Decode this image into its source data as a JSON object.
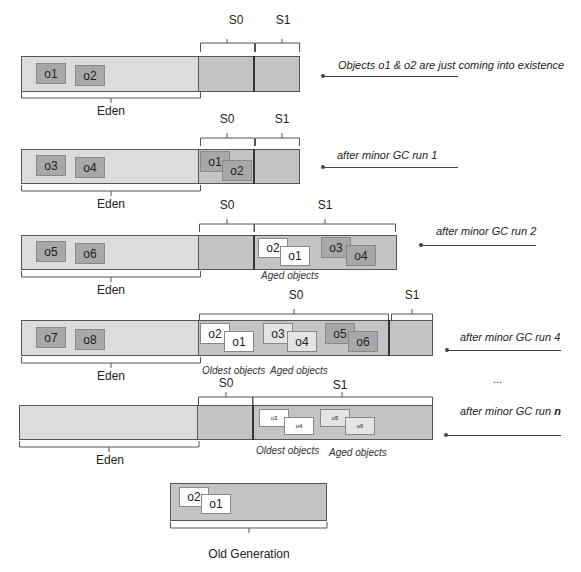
{
  "diagram": {
    "labels": {
      "eden": "Eden",
      "s0": "S0",
      "s1": "S1",
      "old_generation": "Old Generation",
      "aged_objects": "Aged objects",
      "oldest_objects": "Oldest objects",
      "ellipsis": "..."
    },
    "rows": [
      {
        "note": "Objects o1 & o2 are just coming into existence",
        "eden_objects": [
          "o1",
          "o2"
        ],
        "s0_objects": [],
        "s1_objects": []
      },
      {
        "note": "after minor GC run 1",
        "eden_objects": [
          "o3",
          "o4"
        ],
        "s0_objects": [
          "o1",
          "o2"
        ],
        "s1_objects": []
      },
      {
        "note": "after minor GC run 2",
        "eden_objects": [
          "o5",
          "o6"
        ],
        "s0_objects": [],
        "s1_objects": [
          "o2",
          "o1",
          "o3",
          "o4"
        ],
        "s1_caption": "Aged objects"
      },
      {
        "note": "after minor GC run 4",
        "eden_objects": [
          "o7",
          "o8"
        ],
        "s0_objects": [
          "o2",
          "o1",
          "o3",
          "o4",
          "o5",
          "o6"
        ],
        "s0_captions": [
          "Oldest objects",
          "Aged objects"
        ],
        "s1_objects": []
      },
      {
        "note_prefix": "after minor GC run ",
        "note_bold": "n",
        "eden_objects": [],
        "s0_objects": [],
        "s1_objects": [
          "o3",
          "o4",
          "o5",
          "o6"
        ],
        "s1_captions": [
          "Oldest objects",
          "Aged objects"
        ]
      }
    ],
    "old_generation_objects": [
      "o2",
      "o1"
    ]
  }
}
